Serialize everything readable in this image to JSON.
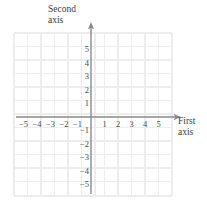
{
  "figure": {
    "type": "coordinate-grid",
    "background_color": "#ffffff",
    "grid_color": "#ededed",
    "axis_color": "#8a8a8a",
    "label_color": "#3b3b3b",
    "tick_label_color": "#4a4a4a"
  },
  "labels": {
    "second_axis_line1": "Second",
    "second_axis_line2": "axis",
    "first_axis_line1": "First",
    "first_axis_line2": "axis"
  },
  "chart_data": {
    "type": "scatter",
    "title": "",
    "subtitle": "",
    "xlabel": "First axis",
    "ylabel": "Second axis",
    "xlim": [
      -6,
      6
    ],
    "ylim": [
      -6,
      6
    ],
    "grid": true,
    "legend": null,
    "x_tick_values": [
      -5,
      -4,
      -3,
      -2,
      -1,
      1,
      2,
      3,
      4,
      5
    ],
    "y_tick_values": [
      5,
      4,
      3,
      2,
      1,
      -1,
      -2,
      -3,
      -4,
      -5
    ],
    "x_tick_labels": [
      "−5",
      "−4",
      "−3",
      "−2",
      "−1",
      "1",
      "2",
      "3",
      "4",
      "5"
    ],
    "y_tick_labels": [
      "5",
      "4",
      "3",
      "2",
      "1",
      "−1",
      "−2",
      "−3",
      "−4",
      "−5"
    ],
    "series": [],
    "x": [],
    "values": [],
    "annotations": [],
    "axis_arrows": [
      "up",
      "right"
    ],
    "grid_columns": 12,
    "grid_rows": 12,
    "cell_size_units": 1
  }
}
